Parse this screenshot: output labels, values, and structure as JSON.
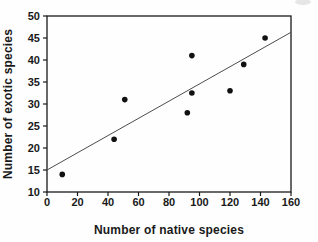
{
  "figure": {
    "background": "#fefefe"
  },
  "chart_data": {
    "type": "scatter",
    "title": "",
    "xlabel": "Number of native species",
    "ylabel": "Number of exotic species",
    "xlim": [
      0,
      160
    ],
    "ylim": [
      10,
      50
    ],
    "x_ticks": [
      0,
      20,
      40,
      60,
      80,
      100,
      120,
      140,
      160
    ],
    "y_ticks": [
      10,
      15,
      20,
      25,
      30,
      35,
      40,
      45,
      50
    ],
    "grid": false,
    "legend": "none",
    "points": [
      {
        "x": 10,
        "y": 14
      },
      {
        "x": 44,
        "y": 22
      },
      {
        "x": 51,
        "y": 31
      },
      {
        "x": 92,
        "y": 28
      },
      {
        "x": 95,
        "y": 32.5
      },
      {
        "x": 95,
        "y": 41
      },
      {
        "x": 120,
        "y": 33
      },
      {
        "x": 129,
        "y": 39
      },
      {
        "x": 143,
        "y": 45
      }
    ],
    "trendline": {
      "x1": 0,
      "y1": 15,
      "x2": 160,
      "y2": 46.3
    },
    "marker_color": "#111111",
    "trend_color": "#4d4d4d",
    "axis_color": "#1a1a1a"
  }
}
